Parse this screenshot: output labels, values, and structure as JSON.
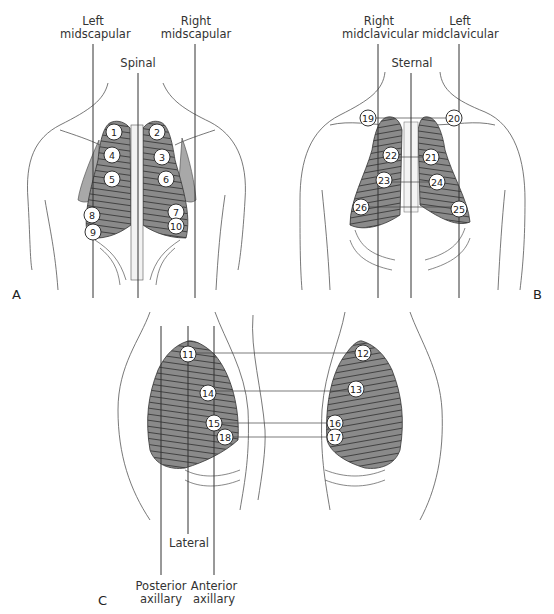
{
  "panels": {
    "A": {
      "letter": "A",
      "view": "posterior chest",
      "lines": {
        "left_midscapular": "Left\nmidscapular",
        "spinal": "Spinal",
        "right_midscapular": "Right\nmidscapular"
      },
      "points": [
        {
          "n": "1",
          "x": 114,
          "y": 132
        },
        {
          "n": "2",
          "x": 157,
          "y": 132
        },
        {
          "n": "3",
          "x": 162,
          "y": 157
        },
        {
          "n": "4",
          "x": 112,
          "y": 155
        },
        {
          "n": "5",
          "x": 112,
          "y": 179
        },
        {
          "n": "6",
          "x": 166,
          "y": 179
        },
        {
          "n": "7",
          "x": 176,
          "y": 212
        },
        {
          "n": "8",
          "x": 92,
          "y": 215
        },
        {
          "n": "9",
          "x": 93,
          "y": 232
        },
        {
          "n": "10",
          "x": 176,
          "y": 226
        }
      ]
    },
    "B": {
      "letter": "B",
      "view": "anterior chest",
      "lines": {
        "right_midclavicular": "Right\nmidclavicular",
        "sternal": "Sternal",
        "left_midclavicular": "Left\nmidclavicular"
      },
      "points": [
        {
          "n": "19",
          "x": 368,
          "y": 118
        },
        {
          "n": "20",
          "x": 454,
          "y": 118
        },
        {
          "n": "21",
          "x": 431,
          "y": 157
        },
        {
          "n": "22",
          "x": 391,
          "y": 155
        },
        {
          "n": "23",
          "x": 384,
          "y": 180
        },
        {
          "n": "24",
          "x": 437,
          "y": 182
        },
        {
          "n": "25",
          "x": 459,
          "y": 209
        },
        {
          "n": "26",
          "x": 361,
          "y": 207
        }
      ]
    },
    "C": {
      "letter": "C",
      "view": "lateral chest",
      "lines": {
        "posterior_axillary": "Posterior\naxillary",
        "lateral": "Lateral",
        "anterior_axillary": "Anterior\naxillary"
      },
      "points": [
        {
          "n": "11",
          "x": 188,
          "y": 354
        },
        {
          "n": "12",
          "x": 363,
          "y": 353
        },
        {
          "n": "13",
          "x": 356,
          "y": 389
        },
        {
          "n": "14",
          "x": 208,
          "y": 393
        },
        {
          "n": "15",
          "x": 214,
          "y": 423
        },
        {
          "n": "16",
          "x": 335,
          "y": 423
        },
        {
          "n": "17",
          "x": 335,
          "y": 437
        },
        {
          "n": "18",
          "x": 225,
          "y": 437
        }
      ]
    }
  },
  "colors": {
    "lung_fill": "#8a8a8a",
    "line": "#333333",
    "outline": "#555555"
  }
}
